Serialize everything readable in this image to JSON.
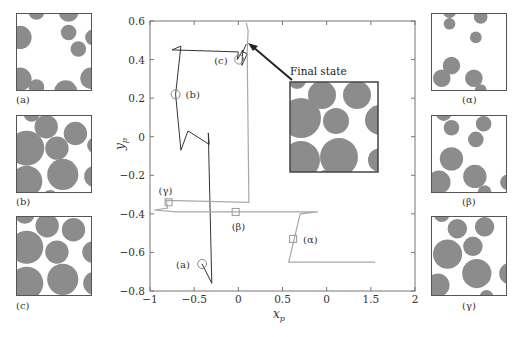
{
  "chart_data": {
    "type": "line",
    "title": "",
    "xlabel": "x_p",
    "ylabel": "y_p",
    "xlim": [
      -1,
      2
    ],
    "ylim": [
      -0.8,
      0.6
    ],
    "x_ticks": [
      "-1",
      "-0.5",
      "0",
      "0.5",
      "0",
      "1.5",
      "2"
    ],
    "y_ticks": [
      "0.6",
      "0.4",
      "0.2",
      "0",
      "-0.2",
      "-0.4",
      "-0.6",
      "-0.8"
    ],
    "grid": false,
    "legend": null,
    "series": [
      {
        "name": "trajectory (a)-(b)-(c)",
        "color": "#333333",
        "points": [
          [
            -0.41,
            -0.66
          ],
          [
            -0.3,
            -0.76
          ],
          [
            -0.34,
            0.02
          ],
          [
            -0.33,
            -0.04
          ],
          [
            -0.57,
            0.03
          ],
          [
            -0.65,
            -0.07
          ],
          [
            -0.71,
            0.22
          ],
          [
            -0.65,
            0.47
          ],
          [
            -0.75,
            0.45
          ],
          [
            0.0,
            0.44
          ],
          [
            -0.01,
            0.4
          ],
          [
            0.05,
            0.45
          ],
          [
            0.04,
            0.37
          ],
          [
            0.1,
            0.43
          ],
          [
            0.05,
            0.44
          ],
          [
            0.09,
            0.48
          ]
        ]
      },
      {
        "name": "trajectory (alpha)-(beta)-(gamma)",
        "color": "#999999",
        "points": [
          [
            1.55,
            -0.65
          ],
          [
            0.57,
            -0.65
          ],
          [
            0.7,
            -0.4
          ],
          [
            0.9,
            -0.39
          ],
          [
            0.1,
            -0.39
          ],
          [
            -0.03,
            -0.39
          ],
          [
            -0.7,
            -0.39
          ],
          [
            -0.95,
            -0.38
          ],
          [
            -0.8,
            -0.37
          ],
          [
            -0.82,
            -0.33
          ],
          [
            0.12,
            -0.34
          ],
          [
            0.1,
            0.44
          ],
          [
            0.11,
            0.55
          ],
          [
            0.09,
            0.59
          ]
        ]
      }
    ],
    "markers": [
      {
        "label": "(a)",
        "x": -0.41,
        "y": -0.66,
        "shape": "circle"
      },
      {
        "label": "(b)",
        "x": -0.71,
        "y": 0.22,
        "shape": "circle"
      },
      {
        "label": "(c)",
        "x": 0.01,
        "y": 0.4,
        "shape": "circle"
      },
      {
        "label": "(α)",
        "x": 0.62,
        "y": -0.53,
        "shape": "square"
      },
      {
        "label": "(β)",
        "x": -0.03,
        "y": -0.39,
        "shape": "square"
      },
      {
        "label": "(γ)",
        "x": -0.79,
        "y": -0.34,
        "shape": "square"
      }
    ],
    "annotations": [
      {
        "text": "Final state",
        "arrow_to": [
          0.09,
          0.48
        ]
      }
    ]
  },
  "labels": {
    "final_state": "Final state",
    "xlabel": "x",
    "xlabel_sub": "p",
    "ylabel": "y",
    "ylabel_sub": "p"
  },
  "panels": {
    "left": [
      {
        "label": "(a)"
      },
      {
        "label": "(b)"
      },
      {
        "label": "(c)"
      }
    ],
    "right": [
      {
        "label": "(α)"
      },
      {
        "label": "(β)"
      },
      {
        "label": "(γ)"
      }
    ]
  },
  "colors": {
    "particle": "#8c8c8c",
    "frame": "#555555",
    "trajectory_dark": "#333333",
    "trajectory_light": "#a8a8a8"
  }
}
